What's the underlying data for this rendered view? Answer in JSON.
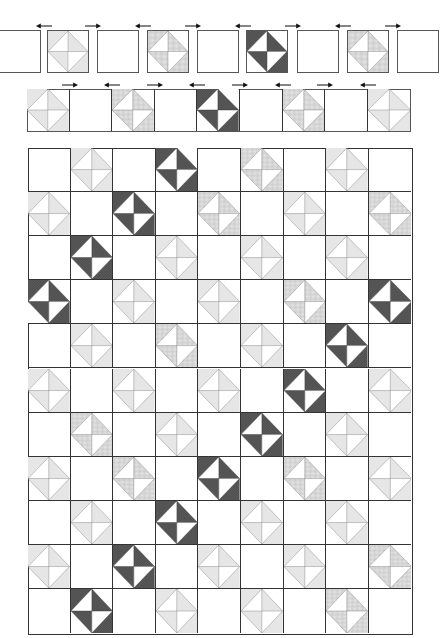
{
  "diagram": {
    "title": "Quilt block layout diagram",
    "legend": {
      "E": "empty-block",
      "L": "light-hourglass-star-block",
      "C": "check-hourglass-star-block",
      "D": "dark-dotted-hourglass-block"
    },
    "colors": {
      "outline": "#555555",
      "grid_line": "#333333",
      "light_fill": "#e2e2e2",
      "check_fill": "#d4d4d4",
      "dark_fill": "#4a4a4a",
      "dot": "#bdbdbd"
    },
    "row1": {
      "blocks": [
        "E",
        "L",
        "E",
        "C",
        "E",
        "D",
        "E",
        "C",
        "E"
      ],
      "arrows": [
        "left",
        "right",
        "left",
        "right",
        "left",
        "right",
        "left",
        "right"
      ]
    },
    "row2": {
      "cells": [
        "L",
        "E",
        "C",
        "E",
        "D",
        "E",
        "C",
        "E",
        "L"
      ],
      "arrows": [
        "right",
        "left",
        "right",
        "left",
        "right",
        "left",
        "right",
        "left"
      ]
    },
    "main_grid": {
      "columns": 9,
      "rows": 11,
      "cells": [
        [
          "E",
          "L",
          "E",
          "D",
          "E",
          "C",
          "E",
          "L",
          "E"
        ],
        [
          "L",
          "E",
          "D",
          "E",
          "C",
          "E",
          "L",
          "E",
          "C"
        ],
        [
          "E",
          "D",
          "E",
          "L",
          "E",
          "L",
          "E",
          "L",
          "E"
        ],
        [
          "D",
          "E",
          "L",
          "E",
          "L",
          "E",
          "C",
          "E",
          "D"
        ],
        [
          "E",
          "L",
          "E",
          "C",
          "E",
          "L",
          "E",
          "D",
          "E"
        ],
        [
          "L",
          "E",
          "L",
          "E",
          "L",
          "E",
          "D",
          "E",
          "L"
        ],
        [
          "E",
          "C",
          "E",
          "L",
          "E",
          "D",
          "E",
          "L",
          "E"
        ],
        [
          "L",
          "E",
          "C",
          "E",
          "D",
          "E",
          "C",
          "E",
          "L"
        ],
        [
          "E",
          "L",
          "E",
          "D",
          "E",
          "L",
          "E",
          "L",
          "E"
        ],
        [
          "L",
          "E",
          "D",
          "E",
          "L",
          "E",
          "L",
          "E",
          "C"
        ],
        [
          "E",
          "D",
          "E",
          "L",
          "E",
          "L",
          "E",
          "C",
          "E"
        ]
      ]
    }
  }
}
